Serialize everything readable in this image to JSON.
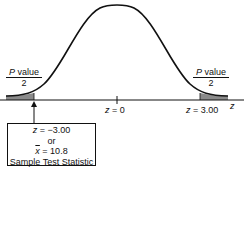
{
  "diagram": {
    "type": "two-tailed normal distribution with p-value regions",
    "left_tail_label": {
      "numerator_italic": "P",
      "numerator_rest": " value",
      "denominator": "2"
    },
    "right_tail_label": {
      "numerator_italic": "P",
      "numerator_rest": " value",
      "denominator": "2"
    },
    "axis": {
      "variable": "z",
      "center_label_var": "z",
      "center_label_value": " = 0",
      "right_label_var": "z",
      "right_label_value": " = 3.00"
    },
    "callout_box": {
      "line1_var": "z",
      "line1_value": " = −3.00",
      "line2": "or",
      "line3_var": "x",
      "line3_value": " = 10.8",
      "line4": "Sample Test Statistic"
    },
    "colors": {
      "curve": "#111111",
      "shade": "#8a8a8a",
      "axis": "#111111"
    }
  }
}
